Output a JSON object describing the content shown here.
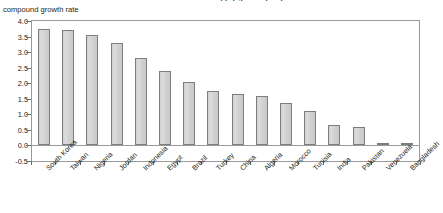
{
  "chart_data": {
    "type": "bar",
    "title": "Estimated labour supply growth per year",
    "ylabel": "compound growth rate",
    "xlabel": "",
    "ylim": [
      -0.5,
      4.0
    ],
    "yticks": [
      "4.0",
      "3.5",
      "3.0",
      "2.5",
      "2.0",
      "1.5",
      "1.0",
      "0.5",
      "0.0",
      "-0.5"
    ],
    "ytick_values": [
      4.0,
      3.5,
      3.0,
      2.5,
      2.0,
      1.5,
      1.0,
      0.5,
      0.0,
      -0.5
    ],
    "grid": false,
    "legend": false,
    "bar_color": "#d4d4d4",
    "bar_border_color": "#7d7d7d",
    "frame_color": "#9a9a9a",
    "categories": [
      "South Korea",
      "Taiwan",
      "Nigeria",
      "Jordan",
      "Indonesia",
      "Egypt",
      "Brazil",
      "Turkey",
      "China",
      "Algeria",
      "Morocco",
      "Tunisia",
      "India",
      "Pakistan",
      "Venezuela",
      "Bangladesh"
    ],
    "values": [
      3.75,
      3.7,
      3.55,
      3.3,
      2.8,
      2.4,
      2.05,
      1.75,
      1.65,
      1.6,
      1.35,
      1.1,
      0.65,
      0.6,
      0.02,
      0.05
    ]
  }
}
